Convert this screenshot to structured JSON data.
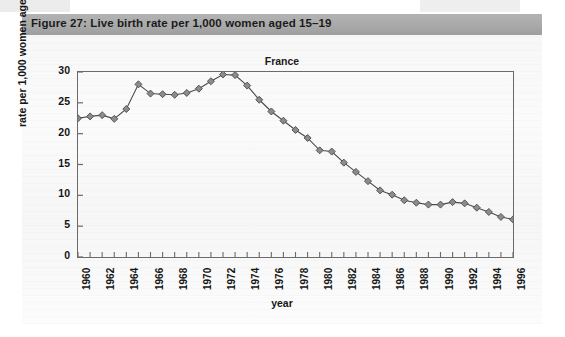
{
  "figure": {
    "caption": "Figure 27:  Live birth rate per 1,000 women aged 15–19"
  },
  "chart_data": {
    "type": "line",
    "title": "France",
    "xlabel": "year",
    "ylabel": "rate per 1,000 women aged 15–19",
    "ylim": [
      0,
      30
    ],
    "yticks": [
      0,
      5,
      10,
      15,
      20,
      25,
      30
    ],
    "xlim": [
      1960,
      1996
    ],
    "xticks": [
      1960,
      1962,
      1964,
      1966,
      1968,
      1970,
      1972,
      1974,
      1976,
      1978,
      1980,
      1982,
      1984,
      1986,
      1988,
      1990,
      1992,
      1994,
      1996
    ],
    "xtick_labels": [
      "1960",
      "1962",
      "1964",
      "1966",
      "1968",
      "1970",
      "1972",
      "1974",
      "1976",
      "1978",
      "1980",
      "1982",
      "1984",
      "1986",
      "1988",
      "1990",
      "1992",
      "1994",
      "1996"
    ],
    "grid": false,
    "legend": null,
    "marker": "diamond",
    "marker_color": "#8c8c8c",
    "line_color": "#4a4a4a",
    "x": [
      1960,
      1961,
      1962,
      1963,
      1964,
      1965,
      1966,
      1967,
      1968,
      1969,
      1970,
      1971,
      1972,
      1973,
      1974,
      1975,
      1976,
      1977,
      1978,
      1979,
      1980,
      1981,
      1982,
      1983,
      1984,
      1985,
      1986,
      1987,
      1988,
      1989,
      1990,
      1991,
      1992,
      1993,
      1994,
      1995,
      1996
    ],
    "values": [
      22.5,
      22.8,
      23.0,
      22.4,
      24.0,
      28.0,
      26.5,
      26.4,
      26.3,
      26.6,
      27.3,
      28.5,
      29.6,
      29.5,
      27.8,
      25.5,
      23.6,
      22.1,
      20.6,
      19.3,
      17.3,
      17.1,
      15.3,
      13.8,
      12.3,
      10.8,
      10.1,
      9.2,
      8.8,
      8.5,
      8.5,
      8.9,
      8.7,
      8.0,
      7.3,
      6.5,
      6.1
    ],
    "series": [
      {
        "name": "France",
        "values": [
          22.5,
          22.8,
          23.0,
          22.4,
          24.0,
          28.0,
          26.5,
          26.4,
          26.3,
          26.6,
          27.3,
          28.5,
          29.6,
          29.5,
          27.8,
          25.5,
          23.6,
          22.1,
          20.6,
          19.3,
          17.3,
          17.1,
          15.3,
          13.8,
          12.3,
          10.8,
          10.1,
          9.2,
          8.8,
          8.5,
          8.5,
          8.9,
          8.7,
          8.0,
          7.3,
          6.5,
          6.1
        ]
      }
    ]
  },
  "colors": {
    "caption_bar": "#a9a9a9",
    "axis": "#6a6a6a",
    "marker_fill": "#8c8c8c",
    "marker_stroke": "#4a4a4a",
    "line": "#4a4a4a",
    "text": "#151515"
  }
}
